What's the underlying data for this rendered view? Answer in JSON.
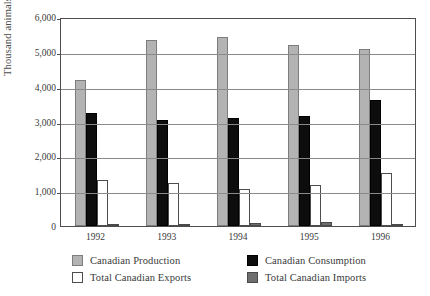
{
  "chart_data": {
    "type": "bar",
    "title": "",
    "subtitle": "",
    "xlabel": "",
    "ylabel": "Thousand animals",
    "categories": [
      "1992",
      "1993",
      "1994",
      "1995",
      "1996"
    ],
    "ylim": [
      0,
      6000
    ],
    "ytick_values": [
      0,
      1000,
      2000,
      3000,
      4000,
      5000,
      6000
    ],
    "ytick_labels": [
      "0",
      "1,000",
      "2,000",
      "3,000",
      "4,000",
      "5,000",
      "6,000"
    ],
    "grid": true,
    "legend_position": "bottom",
    "series": [
      {
        "name": "Canadian Production",
        "key": "production",
        "color": "#b3b3b3",
        "edge_color": "#7d7d7d",
        "values": [
          4200,
          5330,
          5440,
          5190,
          5090
        ]
      },
      {
        "name": "Canadian Consumption",
        "key": "consumption",
        "color": "#0d0d0d",
        "edge_color": "#000000",
        "values": [
          3250,
          3050,
          3090,
          3150,
          3630
        ]
      },
      {
        "name": "Total Canadian Exports",
        "key": "exports",
        "color": "#ffffff",
        "edge_color": "#4d4d4d",
        "values": [
          1320,
          1240,
          1050,
          1180,
          1530
        ]
      },
      {
        "name": "Total Canadian Imports",
        "key": "imports",
        "color": "#6e6e6e",
        "edge_color": "#4a4a4a",
        "values": [
          60,
          70,
          100,
          110,
          70
        ]
      }
    ]
  },
  "legend": {
    "items": [
      {
        "label": "Canadian Production",
        "key": "production"
      },
      {
        "label": "Canadian Consumption",
        "key": "consumption"
      },
      {
        "label": "Total Canadian Exports",
        "key": "exports"
      },
      {
        "label": "Total Canadian Imports",
        "key": "imports"
      }
    ]
  }
}
